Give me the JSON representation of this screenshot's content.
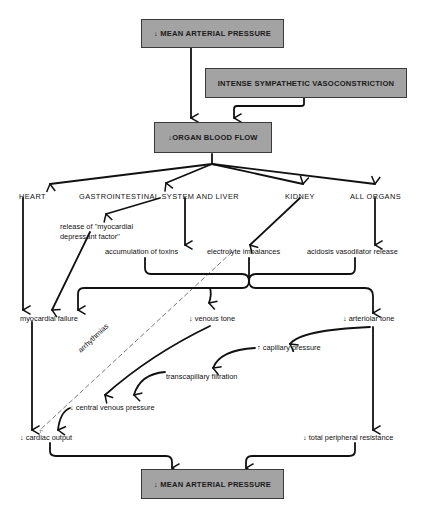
{
  "diagram": {
    "boxes": {
      "top_map": "↓ MEAN ARTERIAL PRESSURE",
      "sympathetic": "INTENSE SYMPATHETIC VASOCONSTRICTION",
      "organ_flow": "↓ORGAN BLOOD FLOW",
      "bottom_map": "↓ MEAN ARTERIAL PRESSURE"
    },
    "organs": {
      "heart": "HEART",
      "gi": "GASTROINTESTINAL SYSTEM AND LIVER",
      "kidney": "KIDNEY",
      "all": "ALL ORGANS"
    },
    "effects": {
      "mdf_line1": "release of ''myocardial",
      "mdf_line2": "depressant factor''",
      "toxins": "accumulation of toxins",
      "electrolyte": "electrolyte imbalances",
      "acidosis": "acidosis vasodilator release"
    },
    "outcomes": {
      "myocardial_failure": "myocardial failure",
      "venous_tone": "↓ venous tone",
      "arteriolar_tone": "↓ arteriolar tone",
      "capillary_pressure": "↑ capillary pressure",
      "transcapillary": "transcapillary filtration",
      "cvp": "↓ central venous pressure",
      "cardiac_output": "↓ cardiac output",
      "tpr": "↓ total peripheral resistance"
    },
    "arrhythmias": "arrhythmias"
  }
}
